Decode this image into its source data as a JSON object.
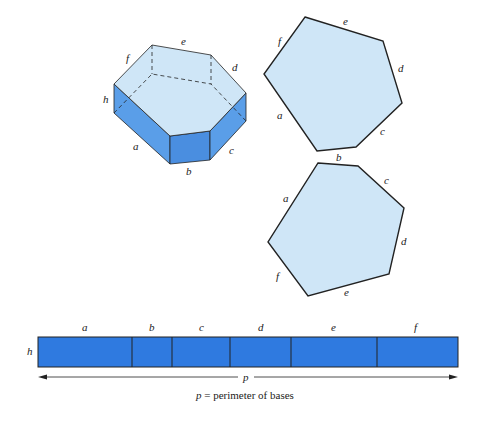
{
  "colors": {
    "face_light": "#cfe6f7",
    "face_side": "#5a9ee8",
    "face_side_dark": "#4a8ee0",
    "strip": "#2f7ae0",
    "stroke": "#222222"
  },
  "prism": {
    "edge_labels": {
      "a": "a",
      "b": "b",
      "c": "c",
      "d": "d",
      "e": "e",
      "f": "f",
      "h": "h"
    }
  },
  "top_base": {
    "edge_labels": {
      "a": "a",
      "b": "b",
      "c": "c",
      "d": "d",
      "e": "e",
      "f": "f"
    }
  },
  "bottom_base": {
    "edge_labels": {
      "a": "a",
      "b": "b",
      "c": "c",
      "d": "d",
      "e": "e",
      "f": "f"
    }
  },
  "lateral_strip": {
    "segments": [
      "a",
      "b",
      "c",
      "d",
      "e",
      "f"
    ],
    "height_label": "h",
    "perimeter_symbol": "p",
    "caption_symbol": "p",
    "caption_text": " = perimeter of bases"
  }
}
